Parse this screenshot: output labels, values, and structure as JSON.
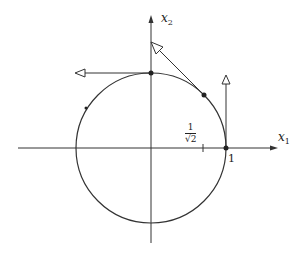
{
  "diagram": {
    "title": "",
    "axes": {
      "x_label": "x",
      "x_sub": "1",
      "y_label": "x",
      "y_sub": "2"
    },
    "tick_labels": {
      "inv_sqrt2_num": "1",
      "inv_sqrt2_den": "√2",
      "one": "1"
    },
    "elements": [
      {
        "type": "circle",
        "center": [
          0,
          0
        ],
        "radius": 1
      },
      {
        "type": "point",
        "at": [
          0,
          1
        ],
        "vector": [
          -1,
          0
        ]
      },
      {
        "type": "point",
        "at": [
          0.707,
          0.707
        ],
        "vector": [
          -0.707,
          0.707
        ]
      },
      {
        "type": "point",
        "at": [
          1,
          0
        ],
        "vector": [
          0,
          1
        ]
      },
      {
        "type": "small-point",
        "at": [
          -0.87,
          0.5
        ]
      }
    ],
    "colors": {
      "stroke": "#333333"
    }
  }
}
